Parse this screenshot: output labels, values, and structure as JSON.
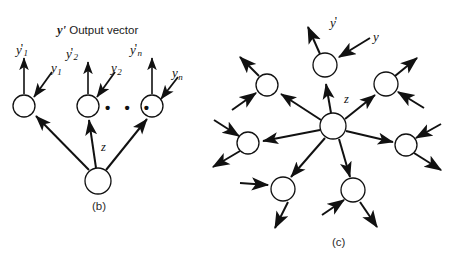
{
  "figure": {
    "background_color": "#ffffff",
    "stroke_color": "#111111",
    "node_fill": "#ffffff",
    "width": 460,
    "height": 262,
    "panels": [
      {
        "id": "b",
        "caption": "(b)",
        "caption_x": 92,
        "caption_y": 201,
        "heading_prefix": "y'",
        "heading_text": " Output vector",
        "heading_x": 57,
        "heading_y": 24,
        "hub": {
          "cx": 98,
          "cy": 181,
          "r": 13
        },
        "output_nodes": [
          {
            "cx": 24,
            "cy": 106,
            "r": 11
          },
          {
            "cx": 88,
            "cy": 106,
            "r": 11
          },
          {
            "cx": 152,
            "cy": 106,
            "r": 11
          }
        ],
        "ellipsis": {
          "x": 105,
          "y": 99,
          "text": "• • •"
        },
        "output_labels": [
          {
            "base": "y",
            "prime": "'",
            "sub": "1",
            "x": 16,
            "y": 41
          },
          {
            "base": "y",
            "prime": "'",
            "sub": "2",
            "x": 66,
            "y": 45
          },
          {
            "base": "y",
            "prime": "'",
            "sub": "n",
            "x": 130,
            "y": 41
          }
        ],
        "input_labels": [
          {
            "base": "y",
            "prime": "",
            "sub": "1",
            "x": 51,
            "y": 61
          },
          {
            "base": "y",
            "prime": "",
            "sub": "2",
            "x": 111,
            "y": 61
          },
          {
            "base": "y",
            "prime": "",
            "sub": "n",
            "x": 172,
            "y": 66
          }
        ],
        "z_label": {
          "text": "z",
          "x": 101,
          "y": 141
        }
      },
      {
        "id": "c",
        "caption": "(c)",
        "caption_x": 332,
        "caption_y": 237,
        "hub": {
          "cx": 333,
          "cy": 126,
          "r": 13
        },
        "z_label": {
          "text": "z",
          "x": 344,
          "y": 93
        },
        "y_prime_label": {
          "base": "y",
          "prime": "'",
          "sub": "",
          "x": 330,
          "y": 14
        },
        "y_label": {
          "base": "y",
          "prime": "",
          "sub": "",
          "x": 373,
          "y": 30
        },
        "satellite_nodes": [
          {
            "cx": 325,
            "cy": 65,
            "r": 12
          },
          {
            "cx": 267,
            "cy": 85,
            "r": 11
          },
          {
            "cx": 386,
            "cy": 84,
            "r": 12
          },
          {
            "cx": 248,
            "cy": 143,
            "r": 11
          },
          {
            "cx": 406,
            "cy": 145,
            "r": 11
          },
          {
            "cx": 283,
            "cy": 189,
            "r": 12
          },
          {
            "cx": 353,
            "cy": 190,
            "r": 12
          }
        ]
      }
    ]
  }
}
